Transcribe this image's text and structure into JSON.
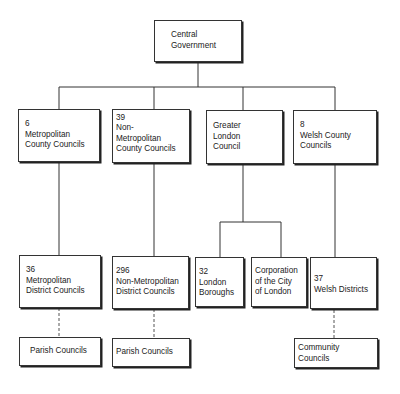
{
  "diagram": {
    "type": "org-chart",
    "root": {
      "lines": [
        "Central",
        "Government"
      ]
    },
    "level1": [
      {
        "lines": [
          "6",
          "Metropolitan",
          "County Councils"
        ]
      },
      {
        "lines": [
          "39",
          "Non-",
          "Metropolitan",
          "County Councils"
        ]
      },
      {
        "lines": [
          "Greater",
          "London",
          "Council"
        ]
      },
      {
        "lines": [
          "8",
          "Welsh County",
          "Councils"
        ]
      }
    ],
    "level2": [
      {
        "lines": [
          "36",
          "Metropolitan",
          "District Councils"
        ]
      },
      {
        "lines": [
          "296",
          "Non-Metropolitan",
          "District Councils"
        ]
      },
      {
        "lines": [
          "32",
          "London",
          "Boroughs"
        ]
      },
      {
        "lines": [
          "Corporation",
          "of the City",
          "of London"
        ]
      },
      {
        "lines": [
          "37",
          "Welsh Districts"
        ]
      }
    ],
    "level3": [
      {
        "lines": [
          "Parish Councils"
        ]
      },
      {
        "lines": [
          "Parish Councils"
        ]
      },
      {
        "lines": [
          "Community",
          "Councils"
        ]
      }
    ],
    "connector_styles": {
      "solid": "direct relationship",
      "dashed": "lower tier link"
    }
  }
}
